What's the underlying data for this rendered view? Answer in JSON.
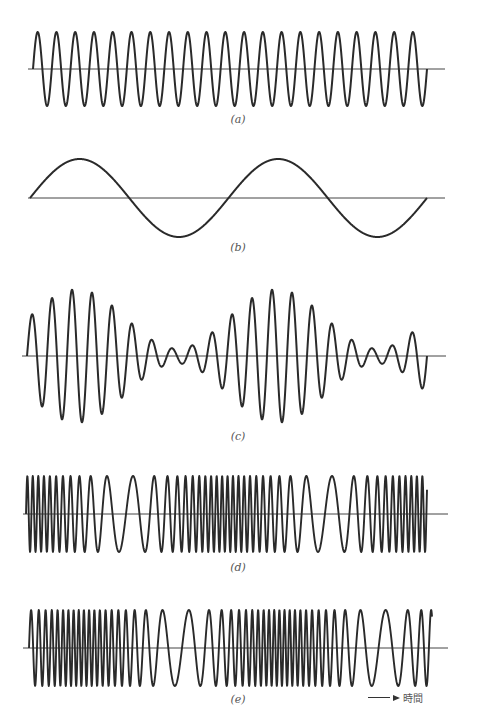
{
  "figure": {
    "stroke_color": "#2a2a2a",
    "axis_color": "#444444",
    "panels": [
      {
        "id": "a",
        "label": "(a)",
        "description": "carrier wave",
        "type": "carrier",
        "axis_y": 69,
        "axis_x0": 28,
        "axis_x1": 445,
        "wave_x0": 33,
        "wave_x1": 427,
        "amplitude": 37,
        "cycles": 21,
        "label_x": 238,
        "label_y": 113
      },
      {
        "id": "b",
        "label": "(b)",
        "description": "modulating signal",
        "type": "sine",
        "axis_y": 198,
        "axis_x0": 28,
        "axis_x1": 445,
        "wave_x0": 30,
        "wave_x1": 427,
        "amplitude": 39,
        "cycles": 2,
        "label_x": 238,
        "label_y": 241
      },
      {
        "id": "c",
        "label": "(c)",
        "description": "amplitude modulated wave",
        "type": "am",
        "axis_y": 356,
        "axis_x0": 22,
        "axis_x1": 446,
        "wave_x0": 27,
        "wave_x1": 427,
        "amplitude": 37,
        "modulation_index": 0.8,
        "cycles": 20,
        "envelope_cycles": 2,
        "label_x": 238,
        "label_y": 430
      },
      {
        "id": "d",
        "label": "(d)",
        "description": "wave with frequency following cosine of modulating signal",
        "type": "fm_cos",
        "axis_y": 514,
        "axis_x0": 23,
        "axis_x1": 448,
        "wave_x0": 26,
        "wave_x1": 427,
        "amplitude": 38,
        "f_center": 0.11,
        "f_deviation": 0.075,
        "envelope_cycles": 2,
        "label_x": 238,
        "label_y": 561
      },
      {
        "id": "e",
        "label": "(e)",
        "description": "wave with frequency following sine of modulating signal",
        "type": "fm_sin",
        "axis_y": 648,
        "axis_x0": 23,
        "axis_x1": 448,
        "wave_x0": 29,
        "wave_x1": 432,
        "amplitude": 38,
        "f_center": 0.115,
        "f_deviation": 0.08,
        "envelope_cycles": 2,
        "label_x": 238,
        "label_y": 693
      }
    ],
    "time_axis": {
      "label": "時間",
      "arrow": "right-arrow",
      "x": 368,
      "y": 690
    }
  }
}
